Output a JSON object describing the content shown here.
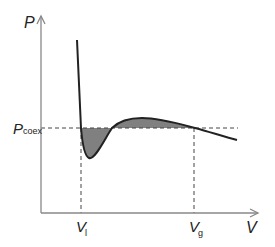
{
  "diagram": {
    "axes": {
      "y_label": "P",
      "x_label": "V"
    },
    "labels": {
      "p_coex_main": "P",
      "p_coex_sub": "coex",
      "v_liquid_main": "V",
      "v_liquid_sub": "l",
      "v_gas_main": "V",
      "v_gas_sub": "g"
    },
    "colors": {
      "axis": "#888888",
      "curve": "#222222",
      "shaded_area": "#808080",
      "dashed": "#444444"
    },
    "elements": [
      "pressure-axis",
      "volume-axis",
      "isotherm-curve",
      "coexistence-pressure-line",
      "liquid-volume-line",
      "gas-volume-line",
      "lower-shaded-area",
      "upper-shaded-area"
    ]
  }
}
